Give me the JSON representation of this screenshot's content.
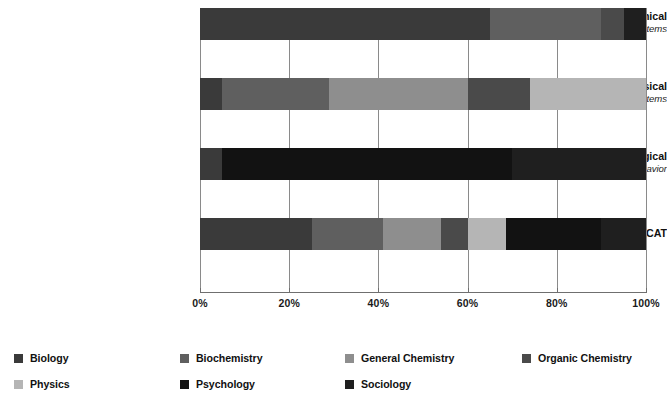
{
  "chart_data": {
    "type": "bar",
    "orientation": "horizontal",
    "stacked": true,
    "normalized": true,
    "title": "",
    "xlabel": "",
    "ylabel": "",
    "xlim": [
      0,
      100
    ],
    "grid": true,
    "legend_position": "bottom",
    "xticks": [
      "0%",
      "20%",
      "40%",
      "60%",
      "80%",
      "100%"
    ],
    "xtick_values": [
      0,
      20,
      40,
      60,
      80,
      100
    ],
    "categories": [
      {
        "main": "Biological and Biochemical",
        "sub": "Foundations of Living Systems"
      },
      {
        "main": "Chemical and Physical",
        "sub": "Foundations of Biological Systems"
      },
      {
        "main": "Psychological, Social, and Biological",
        "sub": "Foundations of Behavior"
      },
      {
        "main": "MCAT",
        "sub": ""
      }
    ],
    "series": [
      {
        "name": "Biology",
        "color": "#3a3a3a",
        "values": [
          65,
          5,
          5,
          25
        ]
      },
      {
        "name": "Biochemistry",
        "color": "#5f5f5f",
        "values": [
          25,
          24,
          0,
          16
        ]
      },
      {
        "name": "General Chemistry",
        "color": "#8e8e8e",
        "values": [
          0,
          31,
          0,
          13
        ]
      },
      {
        "name": "Organic Chemistry",
        "color": "#4a4a4a",
        "values": [
          5,
          14,
          0,
          6
        ]
      },
      {
        "name": "Physics",
        "color": "#b5b5b5",
        "values": [
          0,
          26,
          0,
          8.5
        ]
      },
      {
        "name": "Psychology",
        "color": "#121212",
        "values": [
          0,
          0,
          65,
          21.5
        ]
      },
      {
        "name": "Sociology",
        "color": "#1f1f1f",
        "values": [
          5,
          0,
          30,
          10
        ]
      }
    ],
    "legend": [
      {
        "label": "Biology",
        "color": "#3a3a3a"
      },
      {
        "label": "Biochemistry",
        "color": "#5f5f5f"
      },
      {
        "label": "General Chemistry",
        "color": "#8e8e8e"
      },
      {
        "label": "Organic Chemistry",
        "color": "#4a4a4a"
      },
      {
        "label": "Physics",
        "color": "#b5b5b5"
      },
      {
        "label": "Psychology",
        "color": "#121212"
      },
      {
        "label": "Sociology",
        "color": "#1f1f1f"
      }
    ]
  }
}
